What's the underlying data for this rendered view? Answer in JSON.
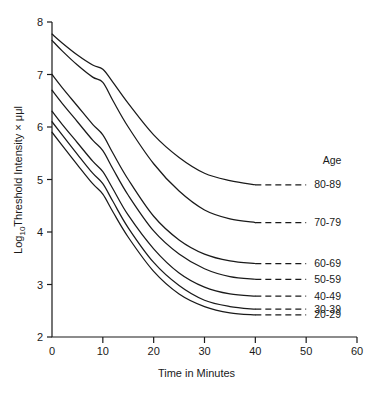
{
  "chart_data": {
    "type": "line",
    "title": "",
    "xlabel": "Time in Minutes",
    "ylabel": "Log10Threshold Intensity × μμl",
    "ylabel_main": "Log",
    "ylabel_sub": "10",
    "ylabel_rest": "Threshold Intensity × μμl",
    "xlim": [
      0,
      60
    ],
    "ylim": [
      2,
      8
    ],
    "xticks": [
      0,
      10,
      20,
      30,
      40,
      50,
      60
    ],
    "yticks": [
      2,
      3,
      4,
      5,
      6,
      7,
      8
    ],
    "xtick_labels": [
      "0",
      "10",
      "20",
      "30",
      "40",
      "50",
      "60"
    ],
    "ytick_labels": [
      "2",
      "3",
      "4",
      "5",
      "6",
      "7",
      "8"
    ],
    "grid": false,
    "legend_position": "right",
    "legend_title": "Age",
    "series": [
      {
        "name": "80-89",
        "label": "80-89",
        "x": [
          0,
          2,
          5,
          8,
          10,
          12,
          15,
          20,
          25,
          30,
          35,
          40
        ],
        "values": [
          7.77,
          7.6,
          7.37,
          7.18,
          7.1,
          6.85,
          6.45,
          5.85,
          5.42,
          5.12,
          4.98,
          4.9
        ],
        "dashed_x": [
          40,
          50
        ],
        "dashed_values": [
          4.9,
          4.9
        ]
      },
      {
        "name": "70-79",
        "label": "70-79",
        "x": [
          0,
          2,
          5,
          8,
          10,
          12,
          15,
          20,
          25,
          30,
          35,
          40
        ],
        "values": [
          7.65,
          7.45,
          7.18,
          6.95,
          6.85,
          6.5,
          6.0,
          5.3,
          4.78,
          4.42,
          4.25,
          4.18
        ],
        "dashed_x": [
          40,
          50
        ],
        "dashed_values": [
          4.18,
          4.18
        ]
      },
      {
        "name": "60-69",
        "label": "60-69",
        "x": [
          0,
          2,
          5,
          8,
          10,
          12,
          15,
          20,
          25,
          30,
          35,
          40
        ],
        "values": [
          7.0,
          6.75,
          6.4,
          6.05,
          5.85,
          5.5,
          5.0,
          4.3,
          3.85,
          3.58,
          3.45,
          3.4
        ],
        "dashed_x": [
          40,
          50
        ],
        "dashed_values": [
          3.4,
          3.4
        ]
      },
      {
        "name": "50-59",
        "label": "50-59",
        "x": [
          0,
          2,
          5,
          8,
          10,
          12,
          15,
          20,
          25,
          30,
          35,
          40
        ],
        "values": [
          6.7,
          6.45,
          6.1,
          5.75,
          5.55,
          5.2,
          4.7,
          4.02,
          3.58,
          3.3,
          3.15,
          3.1
        ],
        "dashed_x": [
          40,
          50
        ],
        "dashed_values": [
          3.1,
          3.1
        ]
      },
      {
        "name": "40-49",
        "label": "40-49",
        "x": [
          0,
          2,
          5,
          8,
          10,
          12,
          15,
          20,
          25,
          30,
          35,
          40
        ],
        "values": [
          6.3,
          6.05,
          5.7,
          5.35,
          5.15,
          4.82,
          4.32,
          3.68,
          3.22,
          2.95,
          2.82,
          2.78
        ],
        "dashed_x": [
          40,
          50
        ],
        "dashed_values": [
          2.78,
          2.78
        ]
      },
      {
        "name": "30-39",
        "label": "30-39",
        "x": [
          0,
          2,
          5,
          8,
          10,
          12,
          15,
          20,
          25,
          30,
          35,
          40
        ],
        "values": [
          6.1,
          5.85,
          5.48,
          5.12,
          4.92,
          4.58,
          4.08,
          3.42,
          2.98,
          2.7,
          2.58,
          2.53
        ],
        "dashed_x": [
          40,
          50
        ],
        "dashed_values": [
          2.53,
          2.53
        ]
      },
      {
        "name": "20-29",
        "label": "20-29",
        "x": [
          0,
          2,
          5,
          8,
          10,
          12,
          15,
          20,
          25,
          30,
          35,
          40
        ],
        "values": [
          5.9,
          5.65,
          5.28,
          4.92,
          4.72,
          4.38,
          3.9,
          3.25,
          2.82,
          2.58,
          2.46,
          2.42
        ],
        "dashed_x": [
          40,
          50
        ],
        "dashed_values": [
          2.42,
          2.42
        ]
      }
    ]
  },
  "legend": {
    "title": "Age",
    "entries": [
      "80-89",
      "70-79",
      "60-69",
      "50-59",
      "40-49",
      "30-39",
      "20-29"
    ]
  },
  "axes": {
    "x_title": "Time in Minutes",
    "y_title_prefix": "Log",
    "y_title_subscript": "10",
    "y_title_suffix": "Threshold Intensity × μμl"
  },
  "colors": {
    "line": "#1a1a1a",
    "background": "#ffffff"
  }
}
